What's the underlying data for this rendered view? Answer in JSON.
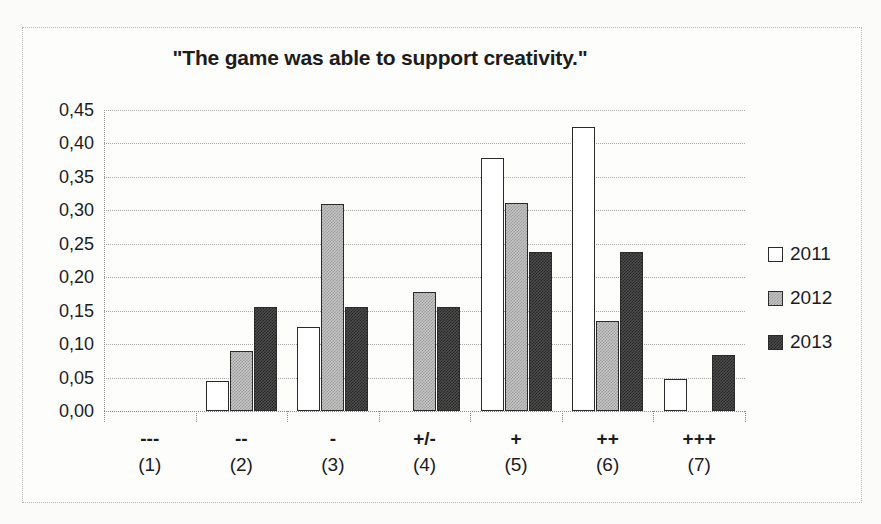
{
  "chart_data": {
    "type": "bar",
    "title": "\"The game was able to support creativity.\"",
    "xlabel": "",
    "ylabel": "",
    "grid": true,
    "legend_position": "right",
    "categories": [
      "---",
      "--",
      "-",
      "+/-",
      "+",
      "++",
      "+++"
    ],
    "category_numbers": [
      "(1)",
      "(2)",
      "(3)",
      "(4)",
      "(5)",
      "(6)",
      "(7)"
    ],
    "ylim": [
      0.0,
      0.45
    ],
    "ytick_labels": [
      "0,45",
      "0,40",
      "0,35",
      "0,30",
      "0,25",
      "0,20",
      "0,15",
      "0,10",
      "0,05",
      "0,00"
    ],
    "ytick_values": [
      0.45,
      0.4,
      0.35,
      0.3,
      0.25,
      0.2,
      0.15,
      0.1,
      0.05,
      0.0
    ],
    "series": [
      {
        "name": "2011",
        "fill": "white",
        "values": [
          0.0,
          0.045,
          0.126,
          0.0,
          0.379,
          0.424,
          0.048
        ]
      },
      {
        "name": "2012",
        "fill": "light-gray",
        "values": [
          0.0,
          0.089,
          0.31,
          0.178,
          0.311,
          0.134,
          0.0
        ]
      },
      {
        "name": "2013",
        "fill": "dark-gray",
        "values": [
          0.0,
          0.155,
          0.156,
          0.156,
          0.237,
          0.237,
          0.083
        ]
      }
    ]
  },
  "legend": {
    "items": [
      {
        "label": "2011"
      },
      {
        "label": "2012"
      },
      {
        "label": "2013"
      }
    ]
  },
  "colors": {
    "series_2011": "#ffffff",
    "series_2012": "#c4c4c4",
    "series_2013": "#4c4c4c",
    "bar_outline": "#2b2b2b",
    "gridline": "#a9a9a9",
    "text": "#1c1c1c",
    "frame": "#b9b9b9",
    "background": "#fdfdfc"
  }
}
